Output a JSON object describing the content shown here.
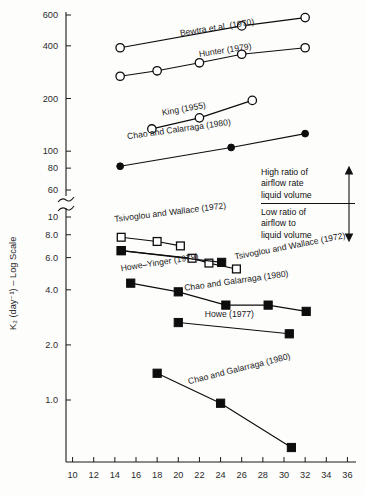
{
  "chart_data": {
    "type": "scatter",
    "title": "",
    "xlabel": "",
    "ylabel": "K₂ (day⁻¹) – Log Scale",
    "yscale": "log",
    "y_axis_break": true,
    "y_break_between": [
      60,
      10
    ],
    "xlim": [
      9,
      37
    ],
    "x_ticks": [
      10,
      12,
      14,
      16,
      18,
      20,
      22,
      24,
      26,
      28,
      30,
      32,
      34,
      36
    ],
    "y_ticks_upper": [
      600,
      400,
      200,
      100,
      80,
      60
    ],
    "y_ticks_lower": [
      10,
      8.0,
      6.0,
      4.0,
      2.0,
      1.0
    ],
    "y_tick_labels_upper": [
      "600",
      "400",
      "200",
      "100",
      "80",
      "60"
    ],
    "y_tick_labels_lower": [
      "10",
      "8.0",
      "6.0",
      "4.0",
      "2.0",
      "1.0"
    ],
    "grid": false,
    "legend": "inline-labels",
    "series": [
      {
        "name": "Bewtra et al. (1970)",
        "marker": "open-circle",
        "label_x": 20.2,
        "label_y": 455,
        "label_rotate": -9,
        "x": [
          14.5,
          26.0,
          32.0
        ],
        "y": [
          390,
          520,
          580
        ]
      },
      {
        "name": "Hunter (1979)",
        "marker": "open-circle",
        "label_x": 22.0,
        "label_y": 345,
        "label_rotate": -9,
        "x": [
          14.5,
          18.0,
          22.0,
          26.0,
          32.0
        ],
        "y": [
          268,
          288,
          320,
          358,
          390
        ]
      },
      {
        "name": "King (1955)",
        "marker": "open-circle",
        "label_x": 18.5,
        "label_y": 160,
        "label_rotate": -10,
        "x": [
          17.5,
          22.0,
          27.0
        ],
        "y": [
          134,
          155,
          195
        ]
      },
      {
        "name": "Chao and Calarraga (1980)",
        "marker": "filled-circle",
        "label_x": 15.2,
        "label_y": 117,
        "label_rotate": -8,
        "x": [
          14.5,
          25.0,
          32.0
        ],
        "y": [
          82,
          105,
          126
        ]
      },
      {
        "name": "Tsivoglou and Wallace (1972)",
        "marker": "open-square",
        "label_x": 14.0,
        "label_y": 9.4,
        "label_rotate": -7,
        "x": [
          14.6,
          18.0,
          20.2
        ],
        "y": [
          7.75,
          7.35,
          6.95
        ]
      },
      {
        "name": "Tsivoglou and Wallace (1972)",
        "marker": "open-square",
        "label_x": 25.4,
        "label_y": 5.85,
        "label_rotate": -11,
        "x": [
          14.6,
          21.3,
          22.9,
          25.5
        ],
        "y": [
          6.55,
          5.95,
          5.6,
          5.2
        ]
      },
      {
        "name": "Howe–Yinger (1979)",
        "marker": "filled-square",
        "label_x": 14.6,
        "label_y": 5.05,
        "label_rotate": -9,
        "x": [
          14.6,
          24.1
        ],
        "y": [
          6.55,
          5.65
        ]
      },
      {
        "name": "Chao and Galarraga (1980)",
        "marker": "filled-square",
        "label_x": 20.6,
        "label_y": 3.95,
        "label_rotate": -8,
        "x": [
          15.5,
          20.0,
          24.5,
          28.5,
          32.1
        ],
        "y": [
          4.35,
          3.9,
          3.3,
          3.3,
          3.05
        ]
      },
      {
        "name": "Howe (1977)",
        "marker": "filled-square",
        "label_x": 22.5,
        "label_y": 2.85,
        "label_rotate": 0,
        "x": [
          20.0,
          30.5
        ],
        "y": [
          2.65,
          2.3
        ]
      },
      {
        "name": "Chao and Galarraga (1980)",
        "marker": "filled-square",
        "label_x": 21.0,
        "label_y": 1.22,
        "label_rotate": -14,
        "x": [
          18.0,
          24.0,
          30.7
        ],
        "y": [
          1.4,
          0.96,
          0.55
        ]
      }
    ],
    "annotations": [
      {
        "id": "high-ratio",
        "lines": [
          "High ratio of",
          "airflow rate",
          "liquid volume"
        ],
        "arrow": "up"
      },
      {
        "id": "low-ratio",
        "lines": [
          "Low ratio of",
          "airflow to",
          "liquid volume"
        ],
        "arrow": "down"
      }
    ]
  },
  "annotation_box": {
    "high": {
      "line1": "High ratio of",
      "line2": "airflow rate",
      "line3": "liquid volume"
    },
    "low": {
      "line1": "Low ratio of",
      "line2": "airflow to",
      "line3": "liquid volume"
    }
  }
}
